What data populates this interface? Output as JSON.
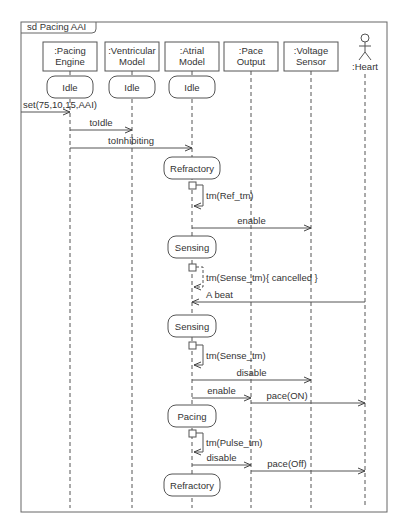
{
  "frame": {
    "label": "sd Pacing AAI"
  },
  "lifelines": [
    {
      "id": "pe",
      "line1": ":Pacing",
      "line2": "Engine",
      "x": 70
    },
    {
      "id": "vm",
      "line1": ":Ventricular",
      "line2": "Model",
      "x": 132
    },
    {
      "id": "am",
      "line1": ":Atrial",
      "line2": "Model",
      "x": 192
    },
    {
      "id": "po",
      "line1": ":Pace",
      "line2": "Output",
      "x": 251
    },
    {
      "id": "vs",
      "line1": ":Voltage",
      "line2": "Sensor",
      "x": 311
    },
    {
      "id": "ht",
      "line1": ":Heart",
      "line2": "",
      "x": 365,
      "actor": true
    }
  ],
  "states": [
    {
      "label": "Idle",
      "lifeline": "pe",
      "y": 87
    },
    {
      "label": "Idle",
      "lifeline": "vm",
      "y": 87
    },
    {
      "label": "Idle",
      "lifeline": "am",
      "y": 87
    },
    {
      "label": "Refractory",
      "lifeline": "am",
      "y": 168
    },
    {
      "label": "Sensing",
      "lifeline": "am",
      "y": 247
    },
    {
      "label": "Sensing",
      "lifeline": "am",
      "y": 326
    },
    {
      "label": "Pacing",
      "lifeline": "am",
      "y": 416
    },
    {
      "label": "Refractory",
      "lifeline": "am",
      "y": 485
    }
  ],
  "messages": [
    {
      "label": "set(75,10,15,AAI)",
      "from": "frame",
      "to": "pe",
      "y": 112
    },
    {
      "label": "toIdle",
      "from": "pe",
      "to": "vm",
      "y": 130
    },
    {
      "label": "toInhibiting",
      "from": "pe",
      "to": "am",
      "y": 148
    },
    {
      "label": "enable",
      "from": "am",
      "to": "vs",
      "y": 228
    },
    {
      "label": "A beat",
      "from": "ht",
      "to": "am",
      "y": 302
    },
    {
      "label": "disable",
      "from": "am",
      "to": "vs",
      "y": 380
    },
    {
      "label": "enable",
      "from": "am",
      "to": "po",
      "y": 398
    },
    {
      "label": "pace(ON)",
      "from": "po",
      "to": "ht",
      "y": 403
    },
    {
      "label": "disable",
      "from": "am",
      "to": "po",
      "y": 465
    },
    {
      "label": "pace(Off)",
      "from": "po",
      "to": "ht",
      "y": 471
    }
  ],
  "timers": [
    {
      "label": "tm(Ref_tm)",
      "y_start": 186,
      "y_end": 206,
      "cancelled": false
    },
    {
      "label": "tm(Sense_tm)",
      "suffix": "{ cancelled }",
      "y_start": 268,
      "y_end": 287,
      "cancelled": true
    },
    {
      "label": "tm(Sense_tm)",
      "y_start": 346,
      "y_end": 365,
      "cancelled": false
    },
    {
      "label": "tm(Pulse_tm)",
      "y_start": 434,
      "y_end": 452,
      "cancelled": false
    }
  ],
  "colors": {
    "line": "#555555",
    "text": "#333333",
    "frame": "#666666"
  }
}
